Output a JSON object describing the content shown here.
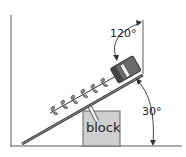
{
  "diagram": {
    "labels": {
      "block": "block",
      "angle_top": "120°",
      "angle_bottom": "30°"
    },
    "colors": {
      "line": "#555555",
      "block_fill": "#cfcfcf",
      "block_stroke": "#666666",
      "motor_fill": "#6a6a6a",
      "motor_dark": "#444444",
      "leaf_fill": "#8a8a8a",
      "background": "#ffffff"
    },
    "elements": [
      "left-wall",
      "floor",
      "right-wall",
      "ramp",
      "block",
      "support-rod",
      "motor-box",
      "auger-shaft",
      "auger-blades",
      "angle-arc-120",
      "angle-arc-30"
    ]
  }
}
